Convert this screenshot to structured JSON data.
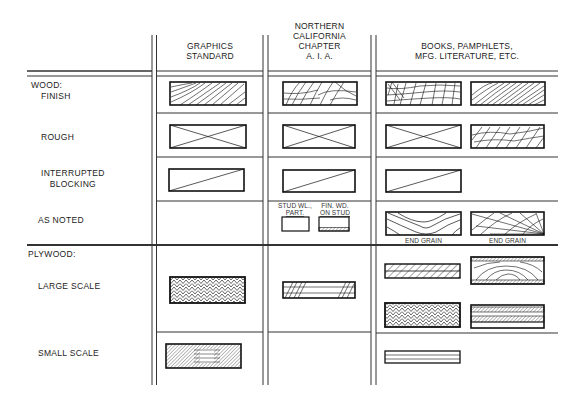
{
  "columns": [
    {
      "label_lines": [
        "GRAPHICS",
        "STANDARD"
      ]
    },
    {
      "label_lines": [
        "NORTHERN",
        "CALIFORNIA",
        "CHAPTER",
        "A. I. A."
      ]
    },
    {
      "label_lines": [
        "BOOKS, PAMPHLETS,",
        "MFG. LITERATURE, ETC."
      ]
    }
  ],
  "sections": {
    "wood": {
      "heading": "WOOD:",
      "rows": [
        {
          "label": "FINISH",
          "symbols": [
            "end-grain-finish",
            "crosshatched-grain-finish",
            "checker-grain",
            "diagonal-grain"
          ]
        },
        {
          "label": "ROUGH",
          "symbols": [
            "x-box",
            "x-box",
            "x-box",
            "rough-grain"
          ]
        },
        {
          "label_lines": [
            "INTERRUPTED",
            "BLOCKING"
          ],
          "symbols": [
            "diagonal-box",
            "diagonal-box",
            "diagonal-box"
          ]
        },
        {
          "label": "AS NOTED",
          "symbols": [
            "stud-wall-partition",
            "finish-wood-on-stud",
            "end-grain",
            "end-grain-radial"
          ]
        }
      ]
    },
    "plywood": {
      "heading": "PLYWOOD:",
      "rows": [
        {
          "label": "LARGE SCALE",
          "symbols": [
            "chevron-plies",
            "layered-hatch",
            "hatched-plies",
            "grain-with-veneer",
            "chevron-plies",
            "double-hatch-plies"
          ]
        },
        {
          "label": "SMALL SCALE",
          "symbols": [
            "dense-hatch",
            "parallel-lines"
          ]
        }
      ]
    }
  },
  "annotations": {
    "stud_wall": [
      "STUD WL.,",
      "PART."
    ],
    "fin_wood": [
      "FIN. WD.",
      "ON STUD"
    ],
    "end_grain_1": "END GRAIN",
    "end_grain_2": "END GRAIN"
  }
}
